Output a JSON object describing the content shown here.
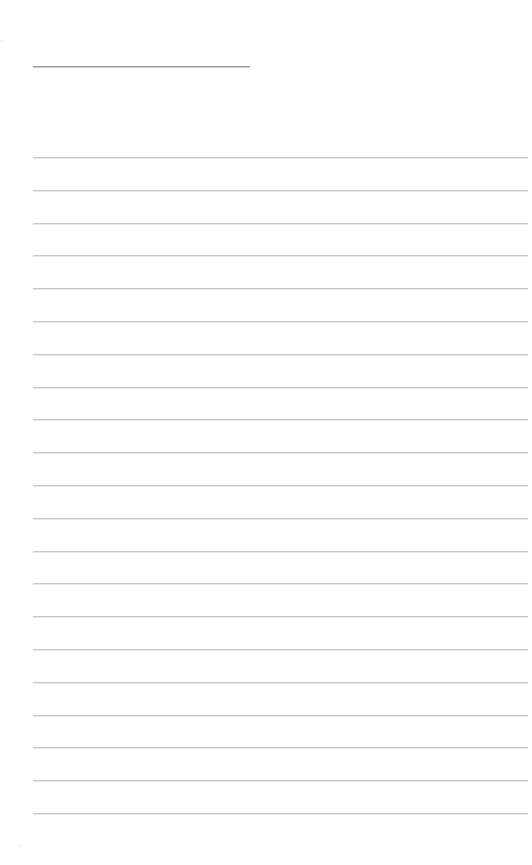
{
  "page": {
    "kind": "ruled-note-page",
    "title_text": "",
    "body_text": "",
    "width": 532,
    "height": 865,
    "background_color": "#ffffff",
    "margin_left": 33,
    "margin_right": 528
  },
  "title_rule": {
    "label": "",
    "x": 33,
    "y": 66,
    "width": 217,
    "color": "#9a9a9e",
    "thickness": 1
  },
  "ruled_lines": {
    "count": 21,
    "first_y": 157,
    "spacing": 32.8,
    "x": 33,
    "width": 495,
    "color": "#c8c8cc",
    "thickness": 1,
    "line_labels": [
      "line-1",
      "line-2",
      "line-3",
      "line-4",
      "line-5",
      "line-6",
      "line-7",
      "line-8",
      "line-9",
      "line-10",
      "line-11",
      "line-12",
      "line-13",
      "line-14",
      "line-15",
      "line-16",
      "line-17",
      "line-18",
      "line-19",
      "line-20",
      "line-21"
    ],
    "line_values": [
      "",
      "",
      "",
      "",
      "",
      "",
      "",
      "",
      "",
      "",
      "",
      "",
      "",
      "",
      "",
      "",
      "",
      "",
      "",
      "",
      ""
    ]
  },
  "artifacts": {
    "left_edge_mark": {
      "x": 0,
      "y": 40,
      "width": 4,
      "height": 2,
      "color": "#f4f4f6"
    },
    "bottom_speckle": {
      "x": 19,
      "y": 844,
      "size": 3,
      "color": "#f1f1f3"
    }
  }
}
